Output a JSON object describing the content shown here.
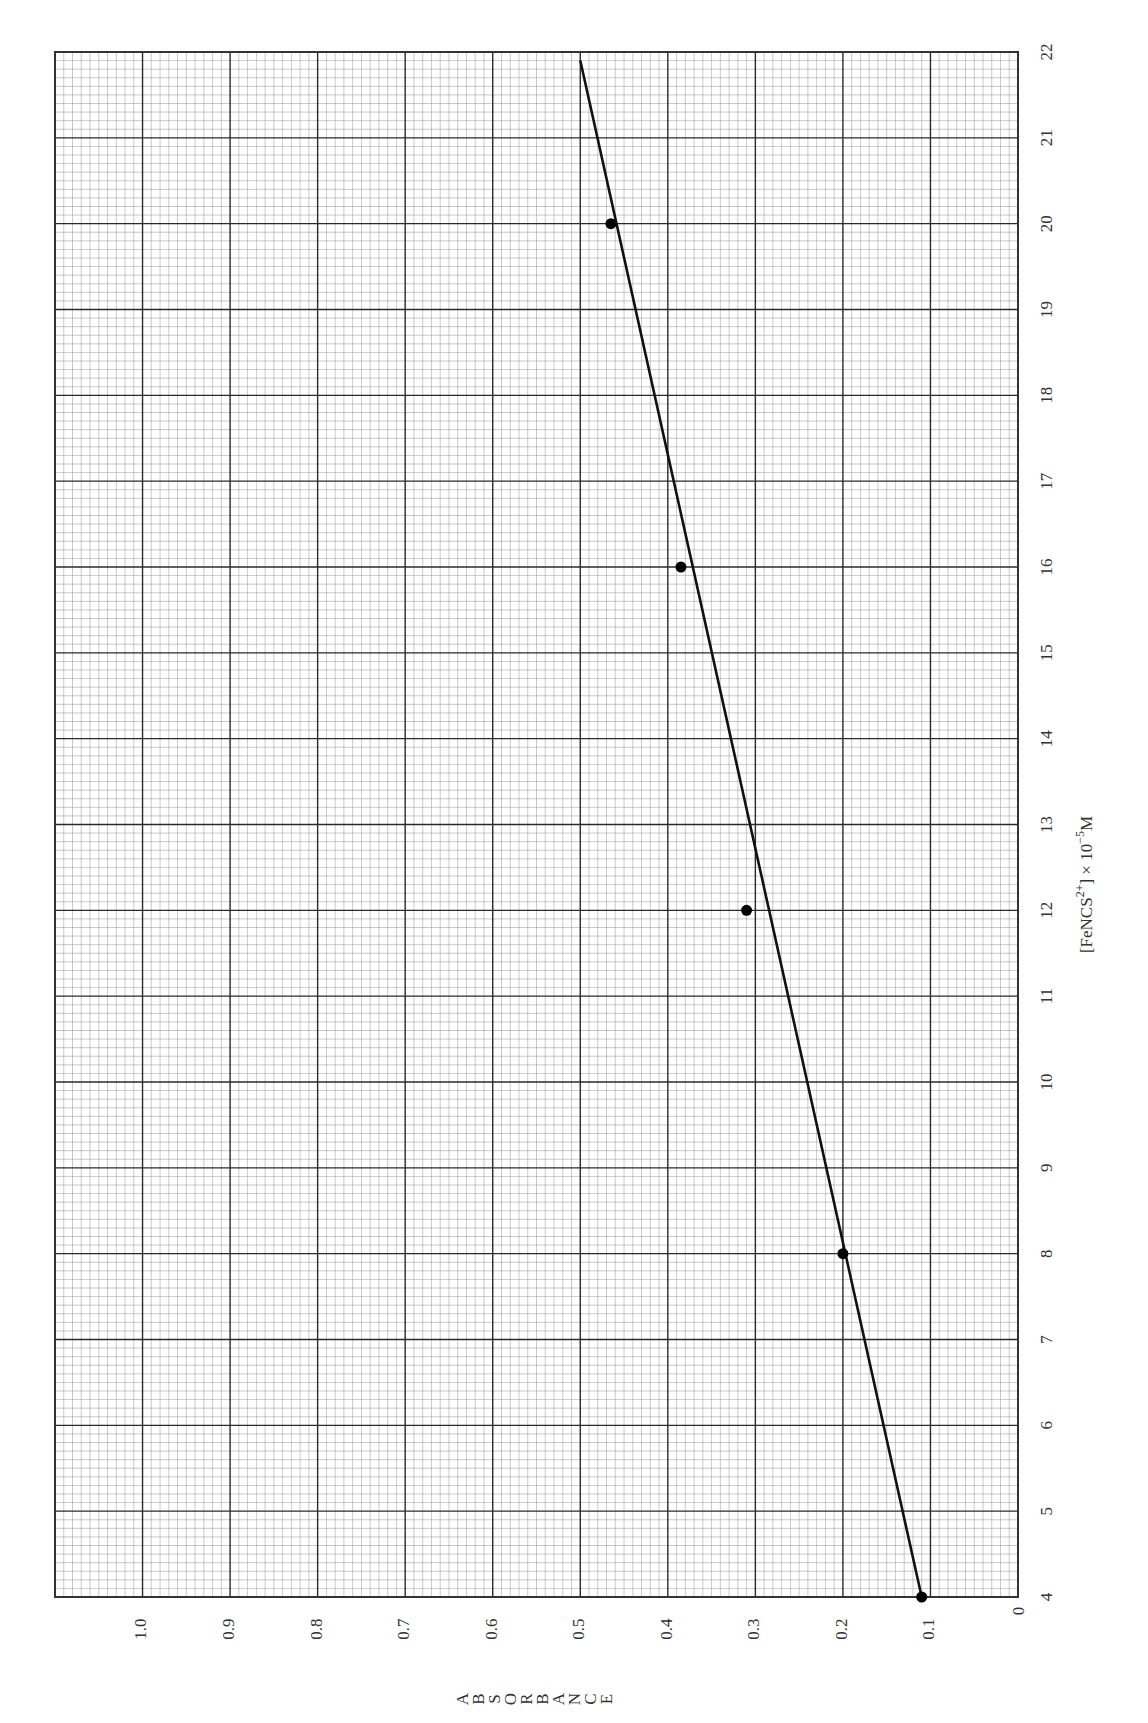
{
  "chart_data": {
    "type": "scatter",
    "orientation": "rotated-90-clockwise",
    "title": "",
    "xlabel": "[FeNCS2+] × 10−5M",
    "xlabel_parts": {
      "base": "[FeNCS",
      "sup": "2+",
      "mid": "] × 10",
      "exp": "−5",
      "unit": "M"
    },
    "ylabel": "ABSORBANCE",
    "ylabel_letters": [
      "A",
      "B",
      "S",
      "O",
      "R",
      "B",
      "A",
      "N",
      "C",
      "E"
    ],
    "x_ticks": [
      4,
      5,
      6,
      7,
      8,
      9,
      10,
      11,
      12,
      13,
      14,
      15,
      16,
      17,
      18,
      19,
      20,
      21,
      22
    ],
    "y_ticks": [
      "0",
      "0.1",
      "0.2",
      "0.3",
      "0.4",
      "0.5",
      "0.6",
      "0.7",
      "0.8",
      "0.9",
      "1.0"
    ],
    "xlim": [
      4,
      22
    ],
    "ylim": [
      0,
      1.1
    ],
    "grid": true,
    "grid_minor_per_major": 10,
    "series": [
      {
        "name": "measured",
        "x": [
          4,
          8,
          12,
          16,
          20
        ],
        "y": [
          0.11,
          0.2,
          0.31,
          0.385,
          0.465
        ],
        "marker": "filled-circle"
      },
      {
        "name": "best-fit line",
        "x": [
          4,
          21.9
        ],
        "y": [
          0.11,
          0.5
        ],
        "style": "solid"
      }
    ],
    "colors": {
      "grid_minor": "#9a9a9a",
      "grid_major": "#2a2a2a",
      "data": "#000000"
    }
  }
}
